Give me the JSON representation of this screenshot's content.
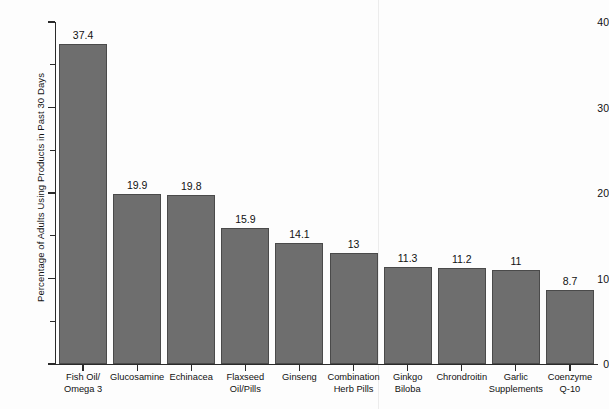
{
  "chart_data": {
    "type": "bar",
    "title": "",
    "subtitle": "",
    "xlabel": "",
    "ylabel": "Percentage of Adults Using Products in Past 30 Days",
    "ylim": [
      0,
      40
    ],
    "xlim": null,
    "grid": false,
    "legend": false,
    "legend_position": "none",
    "bar_color": "#6e6e6e",
    "bar_edge_color": "#4a4a4a",
    "axis_color": "#2a2a2a",
    "value_labels_shown": true,
    "y_major_ticks": [
      0,
      10,
      20,
      30,
      40
    ],
    "y_major_tick_labels": [
      "0",
      "10",
      "20",
      "30",
      "40"
    ],
    "y_minor_ticks": [
      5,
      15,
      25,
      35
    ],
    "categories": [
      "Fish Oil/ Omega 3",
      "Glucosamine",
      "Echinacea",
      "Flaxseed Oil/Pills",
      "Ginseng",
      "Combination Herb Pills",
      "Ginkgo Biloba",
      "Chrondroitin",
      "Garlic Supplements",
      "Coenzyme Q-10"
    ],
    "category_lines": [
      [
        "Fish Oil/",
        "Omega 3"
      ],
      [
        "Glucosamine"
      ],
      [
        "Echinacea"
      ],
      [
        "Flaxseed",
        "Oil/Pills"
      ],
      [
        "Ginseng"
      ],
      [
        "Combination",
        "Herb Pills"
      ],
      [
        "Ginkgo",
        "Biloba"
      ],
      [
        "Chrondroitin"
      ],
      [
        "Garlic",
        "Supplements"
      ],
      [
        "Coenzyme",
        "Q-10"
      ]
    ],
    "values": [
      37.4,
      19.9,
      19.8,
      15.9,
      14.1,
      13,
      11.3,
      11.2,
      11,
      8.7
    ],
    "value_labels": [
      "37.4",
      "19.9",
      "19.8",
      "15.9",
      "14.1",
      "13",
      "11.3",
      "11.2",
      "11",
      "8.7"
    ]
  }
}
